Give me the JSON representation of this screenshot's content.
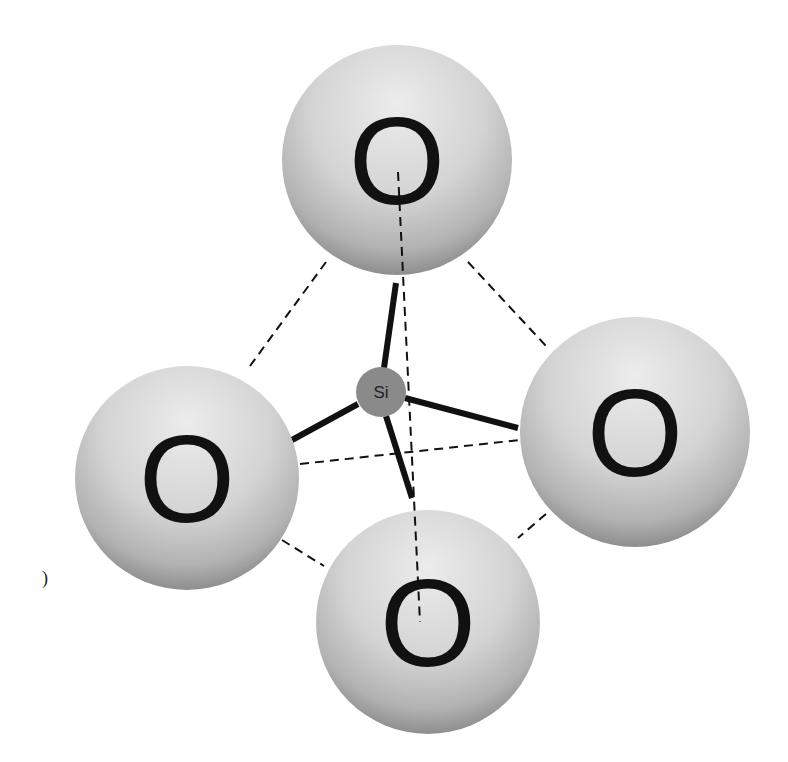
{
  "diagram": {
    "colors": {
      "background": "#ffffff",
      "oxygen_light": "#e6e6e6",
      "oxygen_dark": "#8e8e8e",
      "silicon": "#8a8a8a",
      "bond": "#111111",
      "dashed_edge": "#111111"
    },
    "center_atom": {
      "label": "Si",
      "cx": 381,
      "cy": 392,
      "r": 25
    },
    "oxygen_atoms": [
      {
        "id": "top",
        "label": "O",
        "cx": 397,
        "cy": 160,
        "r": 115
      },
      {
        "id": "left",
        "label": "O",
        "cx": 187,
        "cy": 478,
        "r": 112
      },
      {
        "id": "right",
        "label": "O",
        "cx": 635,
        "cy": 432,
        "r": 115
      },
      {
        "id": "bottom",
        "label": "O",
        "cx": 428,
        "cy": 622,
        "r": 112
      }
    ],
    "bonds": [
      {
        "from": "Si",
        "to": "top",
        "x1": 384,
        "y1": 368,
        "x2": 396,
        "y2": 283
      },
      {
        "from": "Si",
        "to": "left",
        "x1": 358,
        "y1": 404,
        "x2": 292,
        "y2": 440
      },
      {
        "from": "Si",
        "to": "right",
        "x1": 405,
        "y1": 398,
        "x2": 518,
        "y2": 428
      },
      {
        "from": "Si",
        "to": "bottom",
        "x1": 386,
        "y1": 416,
        "x2": 412,
        "y2": 498
      }
    ],
    "dashed_edges": [
      {
        "between": "top-left",
        "x1": 326,
        "y1": 262,
        "x2": 250,
        "y2": 366
      },
      {
        "between": "top-right",
        "x1": 468,
        "y1": 262,
        "x2": 546,
        "y2": 346
      },
      {
        "between": "top-bottom",
        "x1": 398,
        "y1": 172,
        "x2": 420,
        "y2": 622
      },
      {
        "between": "left-right",
        "x1": 300,
        "y1": 464,
        "x2": 520,
        "y2": 440
      },
      {
        "between": "left-bottom",
        "x1": 282,
        "y1": 540,
        "x2": 324,
        "y2": 566
      },
      {
        "between": "right-bottom",
        "x1": 546,
        "y1": 514,
        "x2": 518,
        "y2": 538
      }
    ],
    "stray_mark": ")"
  }
}
